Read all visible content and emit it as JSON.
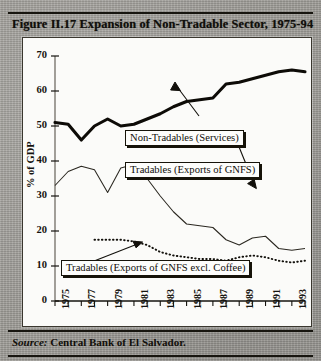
{
  "figure": {
    "title": "Figure II.17  Expansion of Non-Tradable Sector, 1975-94",
    "source_key": "Source:",
    "source_text": "Central Bank of El Salvador."
  },
  "axis": {
    "y_title": "% of GDP",
    "y_ticks": [
      "70",
      "60",
      "50",
      "40",
      "30",
      "20",
      "10",
      "0"
    ],
    "x_ticks": [
      "1975",
      "1977",
      "1979",
      "1981",
      "1983",
      "1985",
      "1987",
      "1989",
      "1991",
      "1993"
    ]
  },
  "annotations": {
    "non_tradables": "Non-Tradables (Services)",
    "tradables": "Tradables (Exports of GNFS)",
    "tradables_excl_coffee": "Tradables (Exports of GNFS excl. Coffee)"
  },
  "colors": {
    "ink": "#100e0a",
    "panel": "#fbfbf9",
    "page": "#9e9c97"
  },
  "chart_data": {
    "type": "line",
    "title": "Figure II.17  Expansion of Non-Tradable Sector, 1975-94",
    "xlabel": "",
    "ylabel": "% of GDP",
    "ylim": [
      0,
      70
    ],
    "xlim": [
      1975,
      1994
    ],
    "grid": false,
    "legend": "annotated callout boxes with leader lines",
    "x": [
      1975,
      1976,
      1977,
      1978,
      1979,
      1980,
      1981,
      1982,
      1983,
      1984,
      1985,
      1986,
      1987,
      1988,
      1989,
      1990,
      1991,
      1992,
      1993,
      1994
    ],
    "series": [
      {
        "name": "Non-Tradables (Services)",
        "style": "thick solid",
        "values": [
          51.0,
          50.5,
          46.0,
          50.0,
          52.0,
          50.0,
          50.5,
          52.0,
          53.5,
          55.5,
          57.0,
          57.5,
          58.0,
          62.0,
          62.5,
          63.5,
          64.5,
          65.5,
          66.0,
          65.5
        ]
      },
      {
        "name": "Tradables (Exports of GNFS)",
        "style": "thin solid",
        "values": [
          33.0,
          37.0,
          38.5,
          37.5,
          31.0,
          38.0,
          39.0,
          35.0,
          30.0,
          25.5,
          22.0,
          21.5,
          21.0,
          17.5,
          16.0,
          18.0,
          18.5,
          15.0,
          14.5,
          15.0
        ]
      },
      {
        "name": "Tradables (Exports of GNFS excl. Coffee)",
        "style": "dotted",
        "values": [
          null,
          null,
          null,
          17.5,
          17.5,
          17.5,
          17.0,
          16.0,
          14.0,
          13.0,
          12.5,
          12.0,
          12.0,
          11.5,
          12.5,
          13.0,
          12.5,
          11.5,
          11.0,
          11.5
        ]
      }
    ]
  }
}
